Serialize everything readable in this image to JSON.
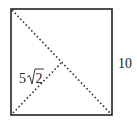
{
  "diagram": {
    "shape": "square",
    "side_label": "10",
    "half_diagonal_label_coef": "5",
    "half_diagonal_label_radicand": "2",
    "colors": {
      "stroke": "#222222",
      "background": "#ffffff"
    },
    "elements": [
      {
        "type": "square",
        "side": 10
      },
      {
        "type": "dotted-line",
        "from": "top-left",
        "to": "bottom-right",
        "description": "full diagonal"
      },
      {
        "type": "dotted-line",
        "from": "bottom-left",
        "to": "center",
        "description": "half diagonal",
        "length_label": "5√2"
      }
    ]
  }
}
